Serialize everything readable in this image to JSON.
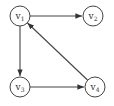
{
  "diagram": {
    "type": "directed-graph",
    "nodes": [
      {
        "id": "v1",
        "label": "v",
        "sub": "1",
        "x": 20,
        "y": 16
      },
      {
        "id": "v2",
        "label": "v",
        "sub": "2",
        "x": 93,
        "y": 16
      },
      {
        "id": "v3",
        "label": "v",
        "sub": "3",
        "x": 20,
        "y": 87
      },
      {
        "id": "v4",
        "label": "v",
        "sub": "4",
        "x": 95,
        "y": 87
      }
    ],
    "edges": [
      {
        "from": "v1",
        "to": "v2"
      },
      {
        "from": "v1",
        "to": "v3"
      },
      {
        "from": "v3",
        "to": "v4"
      },
      {
        "from": "v4",
        "to": "v1"
      }
    ],
    "colors": {
      "stroke": "#444444",
      "text": "#333333",
      "background": "#ffffff"
    }
  }
}
